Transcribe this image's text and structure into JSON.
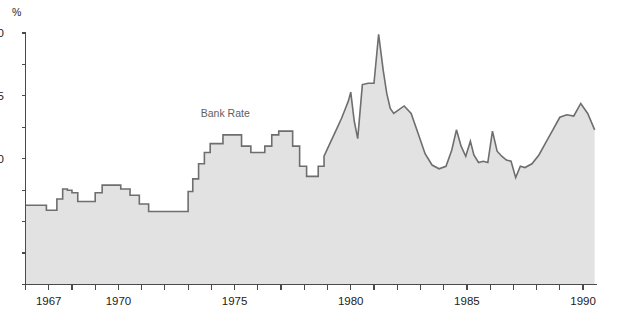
{
  "chart_data": {
    "type": "area",
    "title": "",
    "subtitle": "",
    "xlabel": "",
    "ylabel": "%",
    "grid": false,
    "legend_position": "inline-annotation",
    "annotations": [
      {
        "text": "Bank Rate",
        "x": 1974.6,
        "y": 13.3
      }
    ],
    "xlim": [
      1966.0,
      1990.6
    ],
    "ylim": [
      0,
      20
    ],
    "xticks": [
      1966,
      1967,
      1968,
      1969,
      1970,
      1971,
      1972,
      1973,
      1974,
      1975,
      1976,
      1977,
      1978,
      1979,
      1980,
      1981,
      1982,
      1983,
      1984,
      1985,
      1986,
      1987,
      1988,
      1989,
      1990
    ],
    "xticklabels_shown": [
      "1967",
      "1970",
      "1975",
      "1980",
      "1985",
      "1990"
    ],
    "xticklabel_years": [
      1967,
      1970,
      1975,
      1980,
      1985,
      1990
    ],
    "yticks": [
      0,
      2.5,
      5,
      7.5,
      10,
      12.5,
      15,
      17.5,
      20
    ],
    "yticklabels_shown": [
      "20",
      "15",
      "10",
      "5"
    ],
    "yticklabel_values": [
      20,
      15,
      10,
      5
    ],
    "yticklabels_clipped": true,
    "series": [
      {
        "name": "Bank Rate",
        "x": [
          1966.0,
          1966.4,
          1966.9,
          1967.1,
          1967.35,
          1967.6,
          1967.8,
          1968.0,
          1968.25,
          1968.6,
          1969.0,
          1969.3,
          1969.7,
          1970.1,
          1970.5,
          1970.9,
          1971.3,
          1971.8,
          1972.3,
          1972.8,
          1973.0,
          1973.2,
          1973.45,
          1973.7,
          1973.95,
          1974.2,
          1974.5,
          1974.9,
          1975.3,
          1975.7,
          1976.0,
          1976.3,
          1976.6,
          1976.9,
          1977.2,
          1977.5,
          1977.8,
          1978.1,
          1978.35,
          1978.6,
          1978.85,
          1979.05,
          1979.25,
          1979.45,
          1979.6,
          1979.75,
          1979.9,
          1980.0,
          1980.15,
          1980.3,
          1980.5,
          1980.75,
          1981.0,
          1981.2,
          1981.4,
          1981.55,
          1981.7,
          1981.85,
          1982.0,
          1982.3,
          1982.6,
          1982.9,
          1983.2,
          1983.5,
          1983.8,
          1984.1,
          1984.35,
          1984.55,
          1984.75,
          1984.95,
          1985.15,
          1985.3,
          1985.5,
          1985.7,
          1985.9,
          1986.1,
          1986.3,
          1986.5,
          1986.7,
          1986.9,
          1987.1,
          1987.3,
          1987.5,
          1987.8,
          1988.1,
          1988.4,
          1988.7,
          1989.0,
          1989.3,
          1989.6,
          1989.9,
          1990.2,
          1990.5
        ],
        "y": [
          6.3,
          6.3,
          5.9,
          5.9,
          6.8,
          7.6,
          7.5,
          7.3,
          6.6,
          6.6,
          7.3,
          7.9,
          7.9,
          7.6,
          7.1,
          6.4,
          5.8,
          5.8,
          5.8,
          5.8,
          7.4,
          8.4,
          9.6,
          10.5,
          11.2,
          11.2,
          11.9,
          11.9,
          11.0,
          10.5,
          10.5,
          11.0,
          11.9,
          12.2,
          12.2,
          11.0,
          9.4,
          8.6,
          8.6,
          9.4,
          10.2,
          11.0,
          11.8,
          12.6,
          13.2,
          13.9,
          14.6,
          15.3,
          13.0,
          11.6,
          15.9,
          16.0,
          16.0,
          19.9,
          17.0,
          15.2,
          14.0,
          13.6,
          13.8,
          14.2,
          13.6,
          12.0,
          10.4,
          9.5,
          9.2,
          9.4,
          10.7,
          12.3,
          11.0,
          10.2,
          11.4,
          10.3,
          9.7,
          9.8,
          9.7,
          12.2,
          10.6,
          10.2,
          9.9,
          9.8,
          8.5,
          9.4,
          9.3,
          9.6,
          10.3,
          11.3,
          12.3,
          13.3,
          13.5,
          13.4,
          14.4,
          13.6,
          12.3
        ],
        "fill_color": "#e2e2e2",
        "line_color": "#6e6e6e"
      }
    ]
  },
  "axis": {
    "unit_label": "%",
    "y_visible_labels": [
      "20",
      "15",
      "10",
      "5"
    ],
    "x_labels": [
      "1967",
      "1970",
      "1975",
      "1980",
      "1985",
      "1990"
    ]
  },
  "annotation": {
    "bank_rate_label": "Bank Rate"
  },
  "colors": {
    "fill": "#e2e2e2",
    "line": "#6e6e6e",
    "axis": "#4a4a4a",
    "text": "#1c1c1c",
    "annotation_text": "#5e5e5e",
    "background": "#ffffff"
  }
}
